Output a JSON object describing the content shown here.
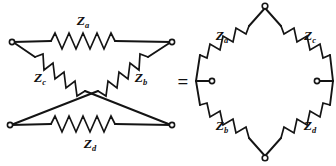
{
  "figure": {
    "name": "lattice-network-equivalence",
    "background_color": "#ffffff",
    "line_color": "#141414",
    "equals_sign": "="
  },
  "impedances": {
    "za": {
      "symbol": "Z",
      "subscript": "a"
    },
    "zb": {
      "symbol": "Z",
      "subscript": "b"
    },
    "zc": {
      "symbol": "Z",
      "subscript": "c"
    },
    "zd": {
      "symbol": "Z",
      "subscript": "d"
    }
  },
  "left_circuit": {
    "name": "lattice-form",
    "labels": {
      "top": "Z",
      "top_sub": "a",
      "left_diag": "Z",
      "left_diag_sub": "c",
      "right_diag": "Z",
      "right_diag_sub": "b",
      "bottom": "Z",
      "bottom_sub": "d"
    },
    "terminals": [
      "top-left",
      "top-right",
      "bottom-left",
      "bottom-right"
    ]
  },
  "right_circuit": {
    "name": "bridge-diamond-form",
    "labels": {
      "upper_left": "Z",
      "upper_left_sub": "a",
      "upper_right": "Z",
      "upper_right_sub": "c",
      "lower_left": "Z",
      "lower_left_sub": "b",
      "lower_right": "Z",
      "lower_right_sub": "d"
    },
    "terminals": [
      "top",
      "left",
      "right",
      "bottom"
    ]
  }
}
